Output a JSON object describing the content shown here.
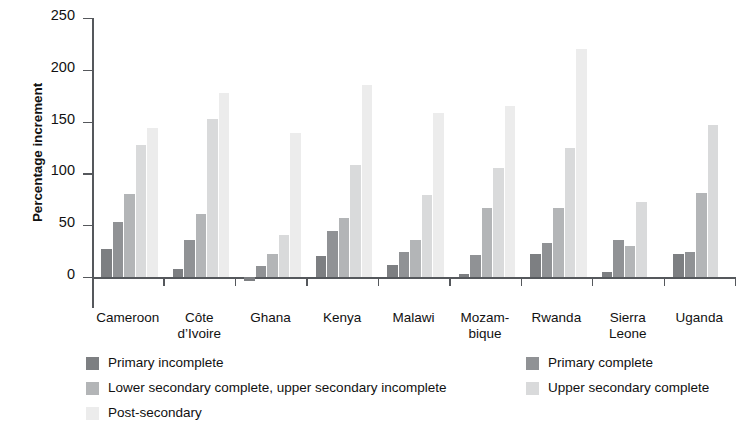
{
  "chart_data": {
    "type": "bar",
    "title": "",
    "subtitle": "",
    "xlabel": "",
    "ylabel": "Percentage increment",
    "ylim": [
      -10,
      250
    ],
    "yticks": [
      0,
      50,
      100,
      150,
      200,
      250
    ],
    "ytick_labels": [
      "0",
      "50",
      "100",
      "150",
      "200",
      "250"
    ],
    "grid": false,
    "legend_position": "bottom",
    "categories": [
      "Cameroon",
      "Côte d’Ivoire",
      "Ghana",
      "Kenya",
      "Malawi",
      "Mozam-\nbique",
      "Rwanda",
      "Sierra\nLeone",
      "Uganda"
    ],
    "series": [
      {
        "name": "Primary incomplete",
        "color": "#7d7f82",
        "values": [
          27,
          8,
          -4,
          20,
          12,
          3,
          22,
          5,
          22
        ]
      },
      {
        "name": "Primary complete",
        "color": "#909295",
        "values": [
          53,
          36,
          11,
          44,
          24,
          21,
          33,
          36,
          24
        ]
      },
      {
        "name": "Lower secondary complete, upper secondary incomplete",
        "color": "#b3b5b7",
        "values": [
          80,
          61,
          22,
          57,
          36,
          67,
          67,
          30,
          81
        ]
      },
      {
        "name": "Upper secondary complete",
        "color": "#d9dadb",
        "values": [
          127,
          153,
          41,
          108,
          79,
          105,
          125,
          72,
          147
        ]
      },
      {
        "name": "Post-secondary",
        "color": "#ececec",
        "values": [
          144,
          178,
          139,
          185,
          158,
          165,
          220,
          null,
          null
        ]
      }
    ]
  },
  "legend": {
    "items": [
      {
        "label": "Primary incomplete",
        "color": "#7d7f82"
      },
      {
        "label": "Primary complete",
        "color": "#909295"
      },
      {
        "label": "Lower secondary complete, upper secondary incomplete",
        "color": "#b3b5b7"
      },
      {
        "label": "Upper secondary complete",
        "color": "#d9dadb"
      },
      {
        "label": "Post-secondary",
        "color": "#ececec"
      }
    ]
  },
  "axis": {
    "y_title": "Percentage increment"
  }
}
